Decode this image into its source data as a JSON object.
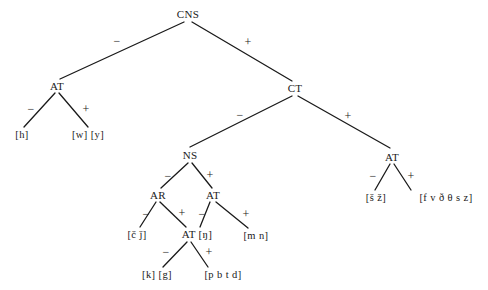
{
  "diagram": {
    "type": "binary-feature-tree",
    "line_color": "#1a1a1a",
    "text_color": "#1a1a1a",
    "background": "#ffffff",
    "nodes": [
      {
        "id": "cns",
        "label": "CNS",
        "x": 188,
        "y": 14,
        "kind": "internal"
      },
      {
        "id": "at_left",
        "label": "AT",
        "x": 57,
        "y": 86,
        "kind": "internal"
      },
      {
        "id": "ct",
        "label": "CT",
        "x": 295,
        "y": 88,
        "kind": "internal"
      },
      {
        "id": "ns",
        "label": "NS",
        "x": 190,
        "y": 155,
        "kind": "internal"
      },
      {
        "id": "at_right",
        "label": "AT",
        "x": 392,
        "y": 157,
        "kind": "internal"
      },
      {
        "id": "ar",
        "label": "AR",
        "x": 158,
        "y": 195,
        "kind": "internal"
      },
      {
        "id": "at_mid",
        "label": "AT",
        "x": 213,
        "y": 195,
        "kind": "internal"
      },
      {
        "id": "at_eng",
        "label": "AT [ŋ]",
        "x": 197,
        "y": 234,
        "kind": "internal"
      }
    ],
    "leaves": [
      {
        "id": "leaf_h",
        "label": "[h]",
        "x": 22,
        "y": 135
      },
      {
        "id": "leaf_wy",
        "label": "[w] [y]",
        "x": 88,
        "y": 135
      },
      {
        "id": "leaf_cj",
        "label": "[č ǰ]",
        "x": 137,
        "y": 235
      },
      {
        "id": "leaf_mn",
        "label": "[m n]",
        "x": 256,
        "y": 236
      },
      {
        "id": "leaf_kg",
        "label": "[k] [g]",
        "x": 157,
        "y": 275
      },
      {
        "id": "leaf_pbtd",
        "label": "[p b t d]",
        "x": 223,
        "y": 275
      },
      {
        "id": "leaf_sz",
        "label": "[š ž]",
        "x": 376,
        "y": 198
      },
      {
        "id": "leaf_fvths",
        "label": "[f v ð θ s z]",
        "x": 446,
        "y": 198
      }
    ],
    "edges": [
      {
        "id": "e_cns_at",
        "from": "cns",
        "to": "leaf_at_left_top",
        "x1": 184,
        "y1": 22,
        "x2": 60,
        "y2": 79,
        "sign": "−",
        "sign_x": 117,
        "sign_y": 41
      },
      {
        "id": "e_cns_ct",
        "from": "cns",
        "to": "ct",
        "x1": 192,
        "y1": 22,
        "x2": 292,
        "y2": 81,
        "sign": "+",
        "sign_x": 248,
        "sign_y": 42
      },
      {
        "id": "e_at_h",
        "from": "at_left",
        "to": "leaf_h",
        "x1": 55,
        "y1": 93,
        "x2": 24,
        "y2": 127,
        "sign": "−",
        "sign_x": 31,
        "sign_y": 109
      },
      {
        "id": "e_at_wy",
        "from": "at_left",
        "to": "leaf_wy",
        "x1": 59,
        "y1": 93,
        "x2": 88,
        "y2": 127,
        "sign": "+",
        "sign_x": 86,
        "sign_y": 109
      },
      {
        "id": "e_ct_ns",
        "from": "ct",
        "to": "ns",
        "x1": 292,
        "y1": 96,
        "x2": 190,
        "y2": 147,
        "sign": "−",
        "sign_x": 240,
        "sign_y": 115
      },
      {
        "id": "e_ct_at",
        "from": "ct",
        "to": "at_right",
        "x1": 298,
        "y1": 96,
        "x2": 390,
        "y2": 148,
        "sign": "+",
        "sign_x": 348,
        "sign_y": 116
      },
      {
        "id": "e_ns_ar",
        "from": "ns",
        "to": "ar",
        "x1": 188,
        "y1": 163,
        "x2": 161,
        "y2": 188,
        "sign": "−",
        "sign_x": 168,
        "sign_y": 176
      },
      {
        "id": "e_ns_atmid",
        "from": "ns",
        "to": "at_mid",
        "x1": 192,
        "y1": 163,
        "x2": 212,
        "y2": 188,
        "sign": "+",
        "sign_x": 210,
        "sign_y": 175
      },
      {
        "id": "e_ar_cj",
        "from": "ar",
        "to": "leaf_cj",
        "x1": 156,
        "y1": 202,
        "x2": 140,
        "y2": 227,
        "sign": "−",
        "sign_x": 146,
        "sign_y": 214
      },
      {
        "id": "e_ar_ateng",
        "from": "ar",
        "to": "at_eng",
        "x1": 160,
        "y1": 202,
        "x2": 186,
        "y2": 227,
        "sign": "+",
        "sign_x": 182,
        "sign_y": 213
      },
      {
        "id": "e_atmid_ateng",
        "from": "at_mid",
        "to": "at_eng",
        "x1": 210,
        "y1": 202,
        "x2": 200,
        "y2": 227,
        "sign": "−",
        "sign_x": 202,
        "sign_y": 214
      },
      {
        "id": "e_atmid_mn",
        "from": "at_mid",
        "to": "leaf_mn",
        "x1": 216,
        "y1": 202,
        "x2": 248,
        "y2": 228,
        "sign": "+",
        "sign_x": 246,
        "sign_y": 214
      },
      {
        "id": "e_ateng_kg",
        "from": "at_eng",
        "to": "leaf_kg",
        "x1": 187,
        "y1": 242,
        "x2": 163,
        "y2": 267,
        "sign": "−",
        "sign_x": 166,
        "sign_y": 252
      },
      {
        "id": "e_ateng_pbtd",
        "from": "at_eng",
        "to": "leaf_pbtd",
        "x1": 191,
        "y1": 242,
        "x2": 208,
        "y2": 267,
        "sign": "+",
        "sign_x": 209,
        "sign_y": 252
      },
      {
        "id": "e_atright_sz",
        "from": "at_right",
        "to": "leaf_sz",
        "x1": 390,
        "y1": 164,
        "x2": 375,
        "y2": 190,
        "sign": "−",
        "sign_x": 373,
        "sign_y": 176
      },
      {
        "id": "e_atright_fv",
        "from": "at_right",
        "to": "leaf_fvths",
        "x1": 394,
        "y1": 164,
        "x2": 411,
        "y2": 190,
        "sign": "+",
        "sign_x": 411,
        "sign_y": 176
      }
    ]
  }
}
